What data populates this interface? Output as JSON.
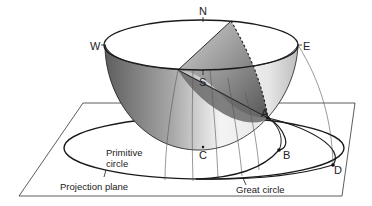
{
  "diagram": {
    "compass": {
      "north": "N",
      "south": "S",
      "east": "E",
      "west": "W"
    },
    "points": {
      "a": "A",
      "b": "B",
      "c": "C",
      "d": "D"
    },
    "labels": {
      "primitive_circle_line1": "Primitive",
      "primitive_circle_line2": "circle",
      "projection_plane": "Projection plane",
      "great_circle": "Great circle"
    },
    "colors": {
      "line": "#1a1a1a",
      "thin_line": "#555555",
      "shade_dark": "#5a5a5a",
      "shade_light": "#f2f2f2",
      "background": "#ffffff"
    }
  }
}
